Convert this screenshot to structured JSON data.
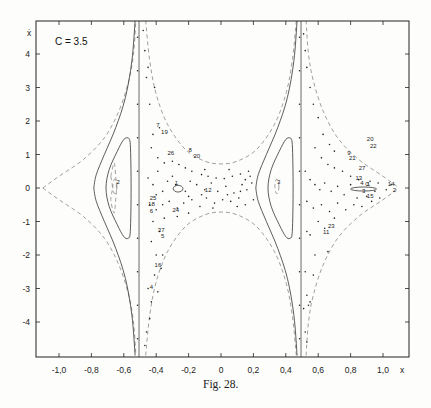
{
  "figure": {
    "param_label": "C = 3.5",
    "caption": "Fig. 28.",
    "x_axis_label": "x",
    "y_axis_label": "ẋ"
  },
  "chart_data": {
    "type": "scatter",
    "title": "C = 3.5",
    "caption": "Fig. 28.",
    "xlabel": "x",
    "ylabel": "ẋ",
    "xlim": [
      -1.15,
      1.16
    ],
    "ylim": [
      -5.0,
      5.0
    ],
    "grid": false,
    "legend": null,
    "x_ticks": [
      -1.0,
      -0.8,
      -0.6,
      -0.4,
      -0.2,
      0,
      0.2,
      0.4,
      0.6,
      0.8,
      1.0
    ],
    "x_tick_labels": [
      "-1,0",
      "-0,8",
      "-0,6",
      "-0,4",
      "-0,2",
      "0",
      "0,2",
      "0,4",
      "0,6",
      "0,8",
      "1,0"
    ],
    "y_ticks": [
      4,
      3,
      2,
      1,
      0,
      -1,
      -2,
      -3,
      -4
    ],
    "y_tick_labels": [
      "4",
      "3",
      "2",
      "1",
      "0",
      "-1",
      "-2",
      "-3",
      "-4"
    ],
    "vertical_lines": [
      -0.506,
      0.494
    ],
    "dashed_curves": [
      {
        "name": "left-outer-upper",
        "points": [
          [
            -1.1,
            0
          ],
          [
            -1.0,
            0.35
          ],
          [
            -0.85,
            0.85
          ],
          [
            -0.72,
            1.5
          ],
          [
            -0.63,
            2.3
          ],
          [
            -0.57,
            3.2
          ],
          [
            -0.54,
            4.0
          ],
          [
            -0.525,
            5.0
          ]
        ]
      },
      {
        "name": "left-outer-lower",
        "points": [
          [
            -1.1,
            0
          ],
          [
            -1.0,
            -0.35
          ],
          [
            -0.85,
            -0.85
          ],
          [
            -0.72,
            -1.5
          ],
          [
            -0.63,
            -2.3
          ],
          [
            -0.57,
            -3.2
          ],
          [
            -0.54,
            -4.0
          ],
          [
            -0.525,
            -5.0
          ]
        ]
      },
      {
        "name": "middle-upper",
        "points": [
          [
            -0.465,
            5.0
          ],
          [
            -0.44,
            3.8
          ],
          [
            -0.4,
            2.8
          ],
          [
            -0.33,
            1.9
          ],
          [
            -0.22,
            1.15
          ],
          [
            -0.1,
            0.8
          ],
          [
            0,
            0.72
          ],
          [
            0.1,
            0.8
          ],
          [
            0.22,
            1.15
          ],
          [
            0.33,
            1.9
          ],
          [
            0.4,
            2.8
          ],
          [
            0.44,
            3.8
          ],
          [
            0.465,
            5.0
          ]
        ]
      },
      {
        "name": "middle-lower",
        "points": [
          [
            -0.465,
            -5.0
          ],
          [
            -0.44,
            -3.8
          ],
          [
            -0.4,
            -2.8
          ],
          [
            -0.33,
            -1.9
          ],
          [
            -0.22,
            -1.15
          ],
          [
            -0.1,
            -0.8
          ],
          [
            0,
            -0.72
          ],
          [
            0.1,
            -0.8
          ],
          [
            0.22,
            -1.15
          ],
          [
            0.33,
            -1.9
          ],
          [
            0.4,
            -2.8
          ],
          [
            0.44,
            -3.8
          ],
          [
            0.465,
            -5.0
          ]
        ]
      },
      {
        "name": "right-outer-upper",
        "points": [
          [
            0.525,
            5.0
          ],
          [
            0.54,
            4.0
          ],
          [
            0.57,
            3.2
          ],
          [
            0.63,
            2.3
          ],
          [
            0.72,
            1.5
          ],
          [
            0.85,
            0.85
          ],
          [
            1.0,
            0.35
          ],
          [
            1.1,
            0
          ]
        ]
      },
      {
        "name": "right-outer-lower",
        "points": [
          [
            0.525,
            -5.0
          ],
          [
            0.54,
            -4.0
          ],
          [
            0.57,
            -3.2
          ],
          [
            0.63,
            -2.3
          ],
          [
            0.72,
            -1.5
          ],
          [
            0.85,
            -0.85
          ],
          [
            1.0,
            -0.35
          ],
          [
            1.1,
            0
          ]
        ]
      },
      {
        "name": "left-inner-orbit",
        "points": [
          [
            -0.68,
            0.35
          ],
          [
            -0.67,
            0
          ],
          [
            -0.68,
            -0.35
          ],
          [
            -0.66,
            -0.75
          ],
          [
            -0.65,
            -0.35
          ],
          [
            -0.645,
            0
          ],
          [
            -0.65,
            0.35
          ],
          [
            -0.66,
            0.75
          ],
          [
            -0.68,
            0.35
          ]
        ]
      }
    ],
    "solid_curves": [
      {
        "name": "left-separatrix-upper",
        "points": [
          [
            -0.53,
            5.0
          ],
          [
            -0.55,
            3.8
          ],
          [
            -0.59,
            2.7
          ],
          [
            -0.65,
            1.8
          ],
          [
            -0.72,
            1.0
          ],
          [
            -0.77,
            0.4
          ],
          [
            -0.785,
            0
          ]
        ]
      },
      {
        "name": "left-separatrix-lower",
        "points": [
          [
            -0.785,
            0
          ],
          [
            -0.77,
            -0.4
          ],
          [
            -0.72,
            -1.0
          ],
          [
            -0.65,
            -1.8
          ],
          [
            -0.59,
            -2.7
          ],
          [
            -0.55,
            -3.8
          ],
          [
            -0.53,
            -5.0
          ]
        ]
      },
      {
        "name": "left-loop",
        "points": [
          [
            -0.575,
            1.5
          ],
          [
            -0.6,
            1.45
          ],
          [
            -0.64,
            1.1
          ],
          [
            -0.69,
            0.55
          ],
          [
            -0.71,
            0
          ],
          [
            -0.69,
            -0.55
          ],
          [
            -0.64,
            -1.1
          ],
          [
            -0.6,
            -1.45
          ],
          [
            -0.575,
            -1.5
          ],
          [
            -0.56,
            -1.3
          ],
          [
            -0.555,
            0
          ],
          [
            -0.56,
            1.3
          ],
          [
            -0.575,
            1.5
          ]
        ]
      },
      {
        "name": "right-separatrix-upper",
        "points": [
          [
            0.47,
            5.0
          ],
          [
            0.45,
            3.8
          ],
          [
            0.41,
            2.7
          ],
          [
            0.35,
            1.8
          ],
          [
            0.28,
            1.0
          ],
          [
            0.23,
            0.4
          ],
          [
            0.215,
            0
          ]
        ]
      },
      {
        "name": "right-separatrix-lower",
        "points": [
          [
            0.215,
            0
          ],
          [
            0.23,
            -0.4
          ],
          [
            0.28,
            -1.0
          ],
          [
            0.35,
            -1.8
          ],
          [
            0.41,
            -2.7
          ],
          [
            0.45,
            -3.8
          ],
          [
            0.47,
            -5.0
          ]
        ]
      },
      {
        "name": "right-loop",
        "points": [
          [
            0.425,
            1.5
          ],
          [
            0.4,
            1.45
          ],
          [
            0.36,
            1.1
          ],
          [
            0.31,
            0.55
          ],
          [
            0.29,
            0
          ],
          [
            0.31,
            -0.55
          ],
          [
            0.36,
            -1.1
          ],
          [
            0.4,
            -1.45
          ],
          [
            0.425,
            -1.5
          ],
          [
            0.44,
            -1.3
          ],
          [
            0.445,
            0
          ],
          [
            0.44,
            1.3
          ],
          [
            0.425,
            1.5
          ]
        ]
      }
    ],
    "closed_orbits": [
      {
        "name": "left-island",
        "cx": -0.655,
        "cy": 0.05,
        "rx": 0.012,
        "ry": 0.22
      },
      {
        "name": "right-island",
        "cx": 0.345,
        "cy": 0.05,
        "rx": 0.012,
        "ry": 0.22
      },
      {
        "name": "center-island",
        "cx": -0.265,
        "cy": -0.02,
        "rx": 0.03,
        "ry": 0.1
      },
      {
        "name": "right-cusp-island",
        "cx": 0.88,
        "cy": -0.03,
        "rx": 0.08,
        "ry": 0.06
      }
    ],
    "scatter_points": [
      [
        -0.48,
        4.7
      ],
      [
        -0.47,
        4.1
      ],
      [
        -0.46,
        3.3
      ],
      [
        -0.44,
        2.5
      ],
      [
        -0.42,
        1.6
      ],
      [
        -0.38,
        1.8
      ],
      [
        -0.41,
        3.0
      ],
      [
        -0.45,
        3.6
      ],
      [
        -0.43,
        1.2
      ],
      [
        -0.39,
        0.9
      ],
      [
        -0.35,
        0.75
      ],
      [
        -0.3,
        0.8
      ],
      [
        -0.26,
        0.7
      ],
      [
        -0.22,
        0.6
      ],
      [
        -0.18,
        0.5
      ],
      [
        -0.12,
        0.4
      ],
      [
        -0.08,
        0.35
      ],
      [
        -0.03,
        0.3
      ],
      [
        0.02,
        0.28
      ],
      [
        0.07,
        0.35
      ],
      [
        0.12,
        0.42
      ],
      [
        0.17,
        0.5
      ],
      [
        -0.45,
        0.3
      ],
      [
        -0.42,
        0.1
      ],
      [
        -0.4,
        -0.2
      ],
      [
        -0.36,
        -0.1
      ],
      [
        -0.33,
        0.2
      ],
      [
        -0.3,
        0.35
      ],
      [
        -0.28,
        0.1
      ],
      [
        -0.22,
        -0.1
      ],
      [
        -0.19,
        0.2
      ],
      [
        -0.15,
        0.1
      ],
      [
        -0.1,
        -0.05
      ],
      [
        -0.06,
        0.15
      ],
      [
        -0.02,
        -0.1
      ],
      [
        0.03,
        0.05
      ],
      [
        0.08,
        -0.15
      ],
      [
        0.13,
        0.1
      ],
      [
        0.16,
        -0.05
      ],
      [
        0.19,
        0.15
      ],
      [
        -0.44,
        -0.5
      ],
      [
        -0.4,
        -0.65
      ],
      [
        -0.36,
        -0.5
      ],
      [
        -0.32,
        -0.4
      ],
      [
        -0.27,
        -0.6
      ],
      [
        -0.23,
        -0.45
      ],
      [
        -0.18,
        -0.35
      ],
      [
        -0.13,
        -0.55
      ],
      [
        -0.09,
        -0.3
      ],
      [
        -0.04,
        -0.45
      ],
      [
        0.01,
        -0.35
      ],
      [
        0.06,
        -0.4
      ],
      [
        0.11,
        -0.3
      ],
      [
        0.15,
        -0.5
      ],
      [
        -0.42,
        -1.0
      ],
      [
        -0.38,
        -1.3
      ],
      [
        -0.35,
        -0.9
      ],
      [
        -0.43,
        -1.6
      ],
      [
        -0.4,
        -2.0
      ],
      [
        -0.36,
        -2.0
      ],
      [
        -0.41,
        -2.6
      ],
      [
        -0.45,
        -3.0
      ],
      [
        -0.43,
        -3.4
      ],
      [
        -0.44,
        -3.9
      ],
      [
        -0.46,
        -4.3
      ],
      [
        -0.47,
        -4.7
      ],
      [
        -0.37,
        -2.4
      ],
      [
        -0.39,
        -3.1
      ],
      [
        0.51,
        4.6
      ],
      [
        0.52,
        4.1
      ],
      [
        0.53,
        3.6
      ],
      [
        0.55,
        3.0
      ],
      [
        0.57,
        2.5
      ],
      [
        0.6,
        2.1
      ],
      [
        0.63,
        1.6
      ],
      [
        0.67,
        1.3
      ],
      [
        0.7,
        1.1
      ],
      [
        0.58,
        1.2
      ],
      [
        0.62,
        0.9
      ],
      [
        0.66,
        0.7
      ],
      [
        0.7,
        0.6
      ],
      [
        0.75,
        0.5
      ],
      [
        0.8,
        0.35
      ],
      [
        0.85,
        0.25
      ],
      [
        0.92,
        0.2
      ],
      [
        0.97,
        0.15
      ],
      [
        0.52,
        0.5
      ],
      [
        0.55,
        0.25
      ],
      [
        0.58,
        0.1
      ],
      [
        0.61,
        -0.05
      ],
      [
        0.64,
        0.15
      ],
      [
        0.68,
        -0.1
      ],
      [
        0.72,
        0.05
      ],
      [
        0.76,
        -0.2
      ],
      [
        0.8,
        0.1
      ],
      [
        0.84,
        -0.3
      ],
      [
        0.9,
        -0.25
      ],
      [
        0.95,
        -0.1
      ],
      [
        1.02,
        -0.05
      ],
      [
        1.05,
        0.1
      ],
      [
        0.53,
        -0.4
      ],
      [
        0.57,
        -0.6
      ],
      [
        0.62,
        -0.5
      ],
      [
        0.67,
        -0.7
      ],
      [
        0.72,
        -0.45
      ],
      [
        0.77,
        -0.65
      ],
      [
        0.82,
        -0.5
      ],
      [
        0.87,
        -0.55
      ],
      [
        0.93,
        -0.4
      ],
      [
        0.98,
        -0.3
      ],
      [
        0.53,
        -1.3
      ],
      [
        0.55,
        -1.4
      ],
      [
        0.6,
        -1.0
      ],
      [
        0.64,
        -1.2
      ],
      [
        0.7,
        -0.9
      ],
      [
        0.58,
        -2.0
      ],
      [
        0.66,
        -1.9
      ],
      [
        0.52,
        -2.5
      ],
      [
        0.57,
        -2.6
      ],
      [
        0.53,
        -3.2
      ],
      [
        0.55,
        -3.4
      ],
      [
        0.51,
        -3.6
      ],
      [
        0.54,
        -3.5
      ],
      [
        0.52,
        -4.3
      ],
      [
        0.53,
        -4.6
      ],
      [
        -0.1,
        0.55
      ],
      [
        0.05,
        0.55
      ],
      [
        0.15,
        0.25
      ],
      [
        -0.2,
        -0.25
      ],
      [
        0.1,
        -0.55
      ],
      [
        -0.05,
        -0.6
      ],
      [
        0.2,
        -0.35
      ],
      [
        0.18,
        0.35
      ],
      [
        -0.39,
        0.5
      ],
      [
        -0.27,
        -0.85
      ],
      [
        -0.2,
        -0.75
      ],
      [
        -0.12,
        -0.2
      ],
      [
        0.04,
        -0.2
      ],
      [
        0.12,
        -0.1
      ],
      [
        -0.515,
        4.5
      ],
      [
        -0.515,
        3.5
      ],
      [
        -0.515,
        2.5
      ],
      [
        -0.515,
        1.5
      ],
      [
        -0.515,
        0.5
      ],
      [
        -0.515,
        -0.5
      ],
      [
        -0.515,
        -1.5
      ],
      [
        -0.515,
        -2.5
      ],
      [
        -0.515,
        -3.5
      ],
      [
        -0.515,
        -4.5
      ],
      [
        0.485,
        4.5
      ],
      [
        0.485,
        3.5
      ],
      [
        0.485,
        2.5
      ],
      [
        0.485,
        1.5
      ],
      [
        0.485,
        0.5
      ],
      [
        0.485,
        -0.5
      ],
      [
        0.485,
        -1.5
      ],
      [
        0.485,
        -2.5
      ],
      [
        0.485,
        -3.5
      ],
      [
        0.485,
        -4.5
      ]
    ],
    "annotations": [
      {
        "text": "7",
        "x": -0.4,
        "y": 1.82
      },
      {
        "text": "19",
        "x": -0.37,
        "y": 1.6
      },
      {
        "text": "26",
        "x": -0.33,
        "y": 1.0
      },
      {
        "text": "8",
        "x": -0.2,
        "y": 1.07
      },
      {
        "text": "20",
        "x": -0.17,
        "y": 0.9
      },
      {
        "text": "1",
        "x": -0.285,
        "y": 0.1
      },
      {
        "text": "12",
        "x": -0.1,
        "y": -0.12
      },
      {
        "text": "25",
        "x": -0.44,
        "y": -0.35
      },
      {
        "text": "18",
        "x": -0.45,
        "y": -0.55
      },
      {
        "text": "6",
        "x": -0.44,
        "y": -0.75
      },
      {
        "text": "24",
        "x": -0.3,
        "y": -0.72
      },
      {
        "text": "37",
        "x": -0.39,
        "y": -1.3
      },
      {
        "text": "5",
        "x": -0.37,
        "y": -1.48
      },
      {
        "text": "16",
        "x": -0.41,
        "y": -2.35
      },
      {
        "text": "4",
        "x": -0.44,
        "y": -3.0
      },
      {
        "text": "2",
        "x": -0.645,
        "y": 0.12
      },
      {
        "text": "3",
        "x": 0.345,
        "y": 0.12
      },
      {
        "text": "20",
        "x": 0.9,
        "y": 1.4
      },
      {
        "text": "22",
        "x": 0.92,
        "y": 1.2
      },
      {
        "text": "9",
        "x": 0.78,
        "y": 1.0
      },
      {
        "text": "21",
        "x": 0.79,
        "y": 0.85
      },
      {
        "text": "27",
        "x": 0.85,
        "y": 0.55
      },
      {
        "text": "13",
        "x": 0.83,
        "y": 0.25
      },
      {
        "text": "1",
        "x": 0.9,
        "y": 0.05
      },
      {
        "text": "3",
        "x": 0.87,
        "y": -0.15
      },
      {
        "text": "15",
        "x": 0.9,
        "y": -0.3
      },
      {
        "text": "4",
        "x": 0.86,
        "y": 0.08
      },
      {
        "text": "0",
        "x": 0.89,
        "y": 0.05
      },
      {
        "text": "14",
        "x": 1.03,
        "y": 0.05
      },
      {
        "text": "2",
        "x": 1.06,
        "y": -0.12
      },
      {
        "text": "23",
        "x": 0.66,
        "y": -1.2
      },
      {
        "text": "11",
        "x": 0.63,
        "y": -1.38
      }
    ]
  }
}
